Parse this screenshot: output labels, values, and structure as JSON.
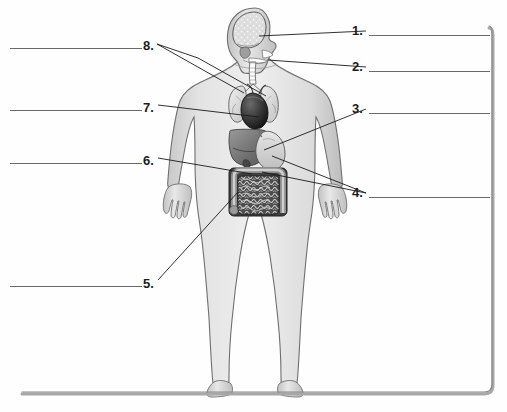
{
  "worksheet": {
    "title": "Human Body Organ Labeling Worksheet",
    "background_color": "#fefefe",
    "ink_color": "#1a1a1a",
    "rule_color": "#6a6a6a",
    "border": {
      "right_x": 490,
      "bottom_y": 396,
      "color": "#9a9a9a"
    }
  },
  "figure": {
    "name": "human-body-anatomy-illustration",
    "organs": [
      "brain",
      "throat-pharynx-trachea",
      "stomach",
      "large-intestine",
      "small-intestine",
      "liver",
      "heart",
      "lungs"
    ]
  },
  "labels": {
    "right_column": [
      {
        "id": "1",
        "number": "1.",
        "number_x": 352,
        "number_y": 24,
        "line_x": 369,
        "line_y": 35,
        "line_w": 121,
        "target_x": 259,
        "target_y": 36,
        "fork": false
      },
      {
        "id": "2",
        "number": "2.",
        "number_x": 352,
        "number_y": 60,
        "line_x": 369,
        "line_y": 71,
        "line_w": 121,
        "target_x": 267,
        "target_y": 60,
        "fork": false
      },
      {
        "id": "3",
        "number": "3.",
        "number_x": 352,
        "number_y": 102,
        "line_x": 369,
        "line_y": 113,
        "line_w": 121,
        "target_x": 265,
        "target_y": 150,
        "fork": false
      },
      {
        "id": "4",
        "number": "4.",
        "number_x": 352,
        "number_y": 186,
        "line_x": 369,
        "line_y": 197,
        "line_w": 121,
        "target_x": 272,
        "target_y": 155,
        "fork": true
      }
    ],
    "left_column": [
      {
        "id": "8",
        "number": "8.",
        "number_x": 143,
        "number_y": 39,
        "line_x": 10,
        "line_y": 48,
        "line_w": 132,
        "target_x": 240,
        "target_y": 92,
        "fork": true
      },
      {
        "id": "7",
        "number": "7.",
        "number_x": 143,
        "number_y": 101,
        "line_x": 10,
        "line_y": 110,
        "line_w": 132,
        "target_x": 266,
        "target_y": 110,
        "fork": false
      },
      {
        "id": "6",
        "number": "6.",
        "number_x": 143,
        "number_y": 154,
        "line_x": 10,
        "line_y": 163,
        "line_w": 132,
        "target_x": 253,
        "target_y": 174,
        "fork": false
      },
      {
        "id": "5",
        "number": "5.",
        "number_x": 143,
        "number_y": 277,
        "line_x": 10,
        "line_y": 286,
        "line_w": 132,
        "target_x": 238,
        "target_y": 192,
        "fork": false
      }
    ]
  }
}
